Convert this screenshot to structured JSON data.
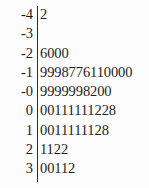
{
  "chart_data": {
    "type": "table",
    "title": "",
    "subtitle": "",
    "xlabel": "",
    "ylabel": "",
    "plot_kind": "stem-and-leaf",
    "divider": "|",
    "stem_label": "",
    "leaf_label": "",
    "rows": [
      {
        "stem": "-4",
        "leaves": "2"
      },
      {
        "stem": "-3",
        "leaves": ""
      },
      {
        "stem": "-2",
        "leaves": "6000"
      },
      {
        "stem": "-1",
        "leaves": "9998776110000"
      },
      {
        "stem": "-0",
        "leaves": "9999998200"
      },
      {
        "stem": "0",
        "leaves": "00111111228"
      },
      {
        "stem": "1",
        "leaves": "0011111128"
      },
      {
        "stem": "2",
        "leaves": "1122"
      },
      {
        "stem": "3",
        "leaves": "00112"
      }
    ],
    "categories": [
      "-4",
      "-3",
      "-2",
      "-1",
      "-0",
      "0",
      "1",
      "2",
      "3"
    ],
    "values": [
      1,
      0,
      4,
      13,
      10,
      11,
      10,
      4,
      5
    ],
    "colors": {
      "background": "#fdfdfd",
      "text": "#1d1d1d",
      "rule": "#2b2b2b"
    }
  }
}
